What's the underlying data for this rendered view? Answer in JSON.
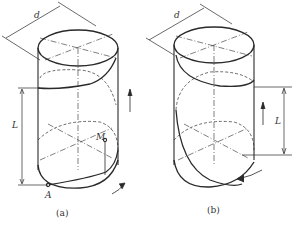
{
  "figure": {
    "panel_a": {
      "caption": "(a)",
      "dimension_diameter": "d",
      "dimension_length": "L",
      "point_start": "A",
      "point_moving": "M"
    },
    "panel_b": {
      "caption": "(b)",
      "dimension_diameter": "d",
      "dimension_length": "L"
    }
  }
}
